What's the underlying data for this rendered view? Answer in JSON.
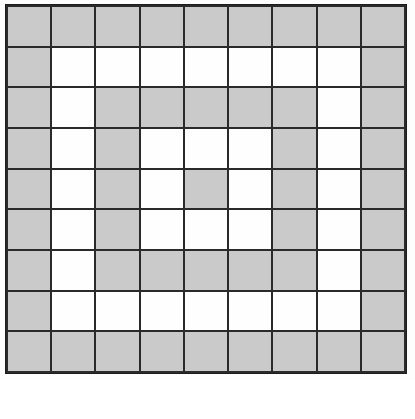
{
  "figure": {
    "type": "binary-cell-grid",
    "rows": 9,
    "columns": 9,
    "colors": {
      "filled": "#cacaca",
      "empty": "#fefefe",
      "gridline": "#2a2a2a",
      "background": "#ffffff"
    },
    "legend": {
      "filled_label": "shaded",
      "empty_label": "blank"
    },
    "caption": ""
  },
  "chart_data": {
    "type": "heatmap",
    "subtitle": "",
    "xlabel": "",
    "ylabel": "",
    "grid": true,
    "legend_position": "none",
    "categories_x": [
      "1",
      "2",
      "3",
      "4",
      "5",
      "6",
      "7",
      "8",
      "9"
    ],
    "categories_y": [
      "1",
      "2",
      "3",
      "4",
      "5",
      "6",
      "7",
      "8",
      "9"
    ],
    "value_labels": {
      "1": "shaded",
      "0": "blank"
    },
    "rows": [
      [
        1,
        1,
        1,
        1,
        1,
        1,
        1,
        1,
        1
      ],
      [
        1,
        0,
        0,
        0,
        0,
        0,
        0,
        0,
        1
      ],
      [
        1,
        0,
        1,
        1,
        1,
        1,
        1,
        0,
        1
      ],
      [
        1,
        0,
        1,
        0,
        0,
        0,
        1,
        0,
        1
      ],
      [
        1,
        0,
        1,
        0,
        1,
        0,
        1,
        0,
        1
      ],
      [
        1,
        0,
        1,
        0,
        0,
        0,
        1,
        0,
        1
      ],
      [
        1,
        0,
        1,
        1,
        1,
        1,
        1,
        0,
        1
      ],
      [
        1,
        0,
        0,
        0,
        0,
        0,
        0,
        0,
        1
      ],
      [
        1,
        1,
        1,
        1,
        1,
        1,
        1,
        1,
        1
      ]
    ],
    "filled_count": 49,
    "empty_count": 32,
    "total_cells": 81
  }
}
